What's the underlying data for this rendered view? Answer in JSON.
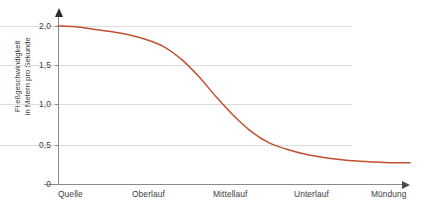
{
  "chart_data": {
    "type": "line",
    "title": "",
    "xlabel": "",
    "ylabel": "Fließgeschwindigkeit in Metern pro Sekunde",
    "ylabel_lines": [
      "Fließgeschwindigkeit",
      "in Metern pro Sekunde"
    ],
    "categories": [
      "Quelle",
      "Oberlauf",
      "Mittellauf",
      "Unterlauf",
      "Mündung"
    ],
    "values": [
      2.0,
      1.78,
      0.72,
      0.31,
      0.27
    ],
    "ylim": [
      0,
      2.0
    ],
    "y_ticks": [
      0,
      0.5,
      1.0,
      1.5,
      2.0
    ],
    "y_tick_labels": [
      "0",
      "0,5",
      "1,0",
      "1,5",
      "2,0"
    ],
    "grid": true,
    "legend": "none",
    "series": [
      {
        "name": "Fließgeschwindigkeit",
        "color": "#c0512f",
        "points": [
          {
            "x": 0.0,
            "y": 2.0
          },
          {
            "x": 0.05,
            "y": 1.99
          },
          {
            "x": 0.1,
            "y": 1.96
          },
          {
            "x": 0.15,
            "y": 1.93
          },
          {
            "x": 0.2,
            "y": 1.89
          },
          {
            "x": 0.25,
            "y": 1.83
          },
          {
            "x": 0.3,
            "y": 1.74
          },
          {
            "x": 0.35,
            "y": 1.58
          },
          {
            "x": 0.4,
            "y": 1.36
          },
          {
            "x": 0.45,
            "y": 1.1
          },
          {
            "x": 0.5,
            "y": 0.86
          },
          {
            "x": 0.55,
            "y": 0.66
          },
          {
            "x": 0.6,
            "y": 0.52
          },
          {
            "x": 0.65,
            "y": 0.44
          },
          {
            "x": 0.7,
            "y": 0.38
          },
          {
            "x": 0.75,
            "y": 0.34
          },
          {
            "x": 0.8,
            "y": 0.31
          },
          {
            "x": 0.85,
            "y": 0.29
          },
          {
            "x": 0.9,
            "y": 0.28
          },
          {
            "x": 0.95,
            "y": 0.27
          },
          {
            "x": 1.0,
            "y": 0.27
          }
        ]
      }
    ],
    "colors": {
      "curve": "#c0512f",
      "gridline": "#dcdcdc",
      "axis": "#8a8a8a",
      "text": "#3c3c3c",
      "background": "#ffffff"
    }
  },
  "axis": {
    "y_labels": [
      "2,0",
      "1,5",
      "1,0",
      "0,5",
      "0"
    ],
    "x_labels": [
      "Quelle",
      "Oberlauf",
      "Mittellauf",
      "Unterlauf",
      "Mündung"
    ],
    "y_title_line1": "Fließgeschwindigkeit",
    "y_title_line2": "in Metern pro Sekunde"
  }
}
